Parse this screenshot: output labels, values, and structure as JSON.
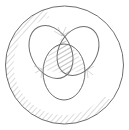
{
  "diagram": {
    "type": "venn-sketch",
    "colors": {
      "stroke": "#6e6e6e",
      "hatch": "#9a9a9a",
      "background": "#ffffff"
    },
    "outer_circle": {
      "cx": 64.5,
      "cy": 65,
      "r": 59
    },
    "lobes": [
      {
        "name": "left",
        "cx": 51,
        "cy": 52,
        "rx": 20,
        "ry": 28,
        "rotate": -28
      },
      {
        "name": "right",
        "cx": 78,
        "cy": 51,
        "rx": 19,
        "ry": 26,
        "rotate": 30
      },
      {
        "name": "bottom",
        "cx": 64,
        "cy": 72,
        "rx": 21,
        "ry": 28,
        "rotate": 0
      }
    ],
    "hatched_regions": [
      "outer-ring-left-side",
      "lobe-intersection-center"
    ]
  }
}
